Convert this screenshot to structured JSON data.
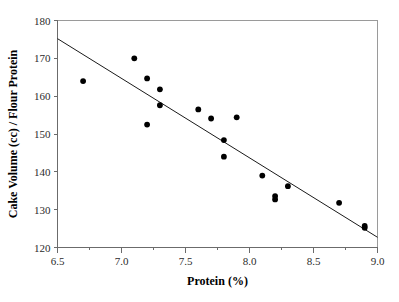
{
  "chart_data": {
    "type": "scatter",
    "title": "",
    "xlabel": "Protein (%)",
    "ylabel": "Cake Volume (cc) / Flour Protein",
    "xlim": [
      6.5,
      9.0
    ],
    "ylim": [
      120,
      180
    ],
    "xticks": [
      "6.5",
      "7.0",
      "7.5",
      "8.0",
      "8.5",
      "9.0"
    ],
    "xtick_values": [
      6.5,
      7.0,
      7.5,
      8.0,
      8.5,
      9.0
    ],
    "yticks": [
      "120",
      "130",
      "140",
      "150",
      "160",
      "170",
      "180"
    ],
    "ytick_values": [
      120,
      130,
      140,
      150,
      160,
      170,
      180
    ],
    "x_minor_ticks": [
      6.75,
      7.25,
      7.75,
      8.25,
      8.75
    ],
    "grid": false,
    "legend": null,
    "marker": "filled-circle",
    "marker_color": "#000000",
    "marker_size": 5,
    "points": [
      {
        "x": 6.7,
        "y": 164.0
      },
      {
        "x": 7.1,
        "y": 170.0
      },
      {
        "x": 7.2,
        "y": 164.7
      },
      {
        "x": 7.2,
        "y": 152.5
      },
      {
        "x": 7.3,
        "y": 161.8
      },
      {
        "x": 7.3,
        "y": 157.6
      },
      {
        "x": 7.6,
        "y": 156.5
      },
      {
        "x": 7.7,
        "y": 154.1
      },
      {
        "x": 7.8,
        "y": 148.4
      },
      {
        "x": 7.8,
        "y": 144.0
      },
      {
        "x": 7.9,
        "y": 154.4
      },
      {
        "x": 8.1,
        "y": 139.0
      },
      {
        "x": 8.2,
        "y": 133.6
      },
      {
        "x": 8.2,
        "y": 132.7
      },
      {
        "x": 8.3,
        "y": 136.2
      },
      {
        "x": 8.7,
        "y": 131.8
      },
      {
        "x": 8.9,
        "y": 125.7
      },
      {
        "x": 8.9,
        "y": 125.2
      }
    ],
    "fit_line": {
      "type": "linear-regression",
      "x_start": 6.5,
      "y_start": 175.2,
      "x_end": 9.0,
      "y_end": 122.7,
      "color": "#1a1a1a"
    }
  }
}
